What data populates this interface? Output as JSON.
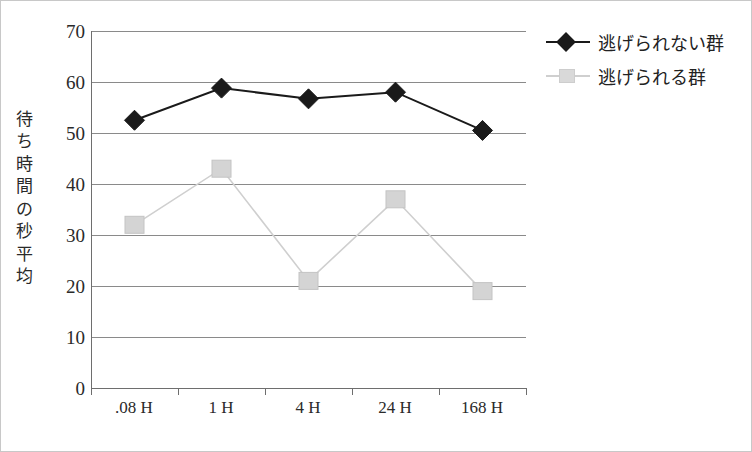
{
  "chart_data": {
    "type": "line",
    "title": "",
    "xlabel": "",
    "ylabel": "待ち時間の秒平均",
    "categories": [
      ".08 H",
      "1 H",
      "4 H",
      "24 H",
      "168 H"
    ],
    "ylim": [
      0,
      70
    ],
    "ytick_step": 10,
    "yticks": [
      70,
      60,
      50,
      40,
      30,
      20,
      10,
      0
    ],
    "grid": true,
    "legend_position": "right-top",
    "series": [
      {
        "name": "逃げられない群",
        "marker": "diamond",
        "color": "#1a1a1a",
        "values": [
          52.5,
          58.8,
          56.7,
          58.0,
          50.5
        ]
      },
      {
        "name": "逃げられる群",
        "marker": "square",
        "color": "#d4d4d4",
        "values": [
          32.0,
          43.0,
          21.0,
          37.0,
          19.0
        ]
      }
    ]
  },
  "axis": {
    "y_title_chars": [
      "待",
      "ち",
      "時",
      "間",
      "の",
      "秒",
      "平",
      "均"
    ]
  },
  "colors": {
    "series_dark": "#1a1a1a",
    "series_light": "#d4d4d4",
    "gridline": "#8a8a8a",
    "axis": "#6e6e6e",
    "text": "#2a2a2a",
    "page_border": "#c8c8c8"
  }
}
